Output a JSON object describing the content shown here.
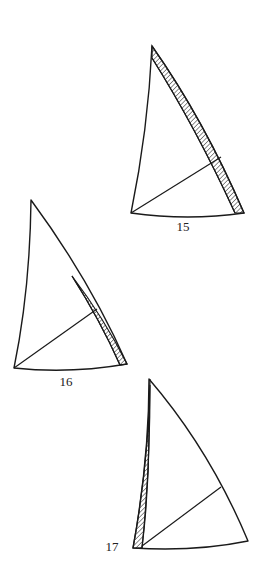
{
  "figures": [
    {
      "id": "15",
      "label": "15",
      "description": "Sail with hatched leech strip",
      "hatched_region": "leech"
    },
    {
      "id": "16",
      "label": "16",
      "description": "Sail with hatched strip on lower leech",
      "hatched_region": "lower-leech"
    },
    {
      "id": "17",
      "label": "17",
      "description": "Sail with hatched luff strip",
      "hatched_region": "luff"
    }
  ],
  "colors": {
    "line": "#1a1a1a",
    "background": "#ffffff"
  }
}
